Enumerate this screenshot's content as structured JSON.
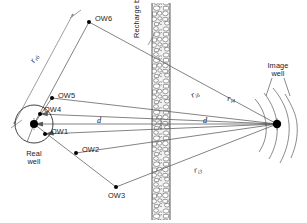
{
  "figure": {
    "background_color": "#ffffff",
    "line_color": "#595959",
    "dot_color": "#000000",
    "boundary_fill": "#e8e8e8",
    "boundary_stroke": "#4a4a4a",
    "width": 307,
    "height": 223
  },
  "labels": {
    "ow6": "OW6",
    "ow5": "OW5",
    "ow4": "OW4",
    "ow1": "OW1",
    "ow2": "OW2",
    "ow3": "OW3",
    "real_well_line1": "Real",
    "real_well_line2": "well",
    "image_well_line1": "Image",
    "image_well_line2": "well",
    "recharge_boundary": "Recharge boundary",
    "d_left": "d",
    "d_right": "d"
  },
  "distances": {
    "r_r6": {
      "symbol": "r",
      "subscript": "r6"
    },
    "r_i6": {
      "symbol": "r",
      "subscript": "i6"
    },
    "r_i4": {
      "symbol": "r",
      "subscript": "i4"
    },
    "r_i3": {
      "symbol": "r",
      "subscript": "i3"
    }
  },
  "geometry": {
    "real_well": {
      "x": 34,
      "y": 124
    },
    "image_well": {
      "x": 277,
      "y": 124
    },
    "boundary_x_left": 152,
    "boundary_x_right": 170,
    "observation_wells": [
      {
        "name": "OW6",
        "x": 89,
        "y": 22
      },
      {
        "name": "OW5",
        "x": 52,
        "y": 98
      },
      {
        "name": "OW4",
        "x": 40,
        "y": 114
      },
      {
        "name": "OW1",
        "x": 45,
        "y": 134
      },
      {
        "name": "OW2",
        "x": 76,
        "y": 153
      },
      {
        "name": "OW3",
        "x": 116,
        "y": 187
      }
    ],
    "real_well_circle_radius": 19
  }
}
